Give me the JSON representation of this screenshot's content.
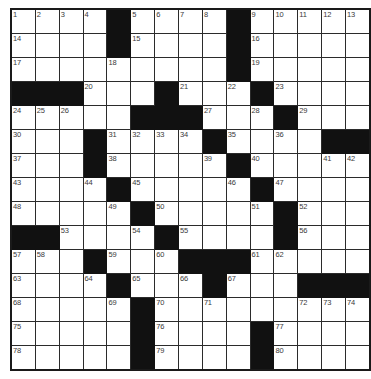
{
  "puzzle": {
    "title": "Crossword Grid",
    "rows": 15,
    "cols": 15,
    "cell_size_px": 23,
    "colors": {
      "block": "#111111",
      "cell": "#ffffff",
      "border": "#2b2b2b",
      "number": "#3a3a3a"
    },
    "grid": [
      [
        {
          "type": "cell",
          "number": "1"
        },
        {
          "type": "cell",
          "number": "2"
        },
        {
          "type": "cell",
          "number": "3"
        },
        {
          "type": "cell",
          "number": "4"
        },
        {
          "type": "block"
        },
        {
          "type": "cell",
          "number": "5"
        },
        {
          "type": "cell",
          "number": "6"
        },
        {
          "type": "cell",
          "number": "7"
        },
        {
          "type": "cell",
          "number": "8"
        },
        {
          "type": "block"
        },
        {
          "type": "cell",
          "number": "9"
        },
        {
          "type": "cell",
          "number": "10"
        },
        {
          "type": "cell",
          "number": "11"
        },
        {
          "type": "cell",
          "number": "12"
        },
        {
          "type": "cell",
          "number": "13"
        }
      ],
      [
        {
          "type": "cell",
          "number": "14"
        },
        {
          "type": "cell"
        },
        {
          "type": "cell"
        },
        {
          "type": "cell"
        },
        {
          "type": "block"
        },
        {
          "type": "cell",
          "number": "15"
        },
        {
          "type": "cell"
        },
        {
          "type": "cell"
        },
        {
          "type": "cell"
        },
        {
          "type": "block"
        },
        {
          "type": "cell",
          "number": "16"
        },
        {
          "type": "cell"
        },
        {
          "type": "cell"
        },
        {
          "type": "cell"
        },
        {
          "type": "cell"
        }
      ],
      [
        {
          "type": "cell",
          "number": "17"
        },
        {
          "type": "cell"
        },
        {
          "type": "cell"
        },
        {
          "type": "cell"
        },
        {
          "type": "cell",
          "number": "18"
        },
        {
          "type": "cell"
        },
        {
          "type": "cell"
        },
        {
          "type": "cell"
        },
        {
          "type": "cell"
        },
        {
          "type": "block"
        },
        {
          "type": "cell",
          "number": "19"
        },
        {
          "type": "cell"
        },
        {
          "type": "cell"
        },
        {
          "type": "cell"
        },
        {
          "type": "cell"
        }
      ],
      [
        {
          "type": "block"
        },
        {
          "type": "block"
        },
        {
          "type": "block"
        },
        {
          "type": "cell",
          "number": "20"
        },
        {
          "type": "cell"
        },
        {
          "type": "cell"
        },
        {
          "type": "block"
        },
        {
          "type": "cell",
          "number": "21"
        },
        {
          "type": "cell"
        },
        {
          "type": "cell",
          "number": "22"
        },
        {
          "type": "block"
        },
        {
          "type": "cell",
          "number": "23"
        },
        {
          "type": "cell"
        },
        {
          "type": "cell"
        },
        {
          "type": "cell"
        }
      ],
      [
        {
          "type": "cell",
          "number": "24"
        },
        {
          "type": "cell",
          "number": "25"
        },
        {
          "type": "cell",
          "number": "26"
        },
        {
          "type": "cell"
        },
        {
          "type": "cell"
        },
        {
          "type": "block"
        },
        {
          "type": "block"
        },
        {
          "type": "block"
        },
        {
          "type": "cell",
          "number": "27"
        },
        {
          "type": "cell"
        },
        {
          "type": "cell",
          "number": "28"
        },
        {
          "type": "block"
        },
        {
          "type": "cell",
          "number": "29"
        },
        {
          "type": "cell"
        },
        {
          "type": "cell"
        }
      ],
      [
        {
          "type": "cell",
          "number": "30"
        },
        {
          "type": "cell"
        },
        {
          "type": "cell"
        },
        {
          "type": "block"
        },
        {
          "type": "cell",
          "number": "31"
        },
        {
          "type": "cell",
          "number": "32"
        },
        {
          "type": "cell",
          "number": "33"
        },
        {
          "type": "cell",
          "number": "34"
        },
        {
          "type": "block"
        },
        {
          "type": "cell",
          "number": "35"
        },
        {
          "type": "cell"
        },
        {
          "type": "cell",
          "number": "36"
        },
        {
          "type": "cell"
        },
        {
          "type": "block"
        },
        {
          "type": "block"
        }
      ],
      [
        {
          "type": "cell",
          "number": "37"
        },
        {
          "type": "cell"
        },
        {
          "type": "cell"
        },
        {
          "type": "block"
        },
        {
          "type": "cell",
          "number": "38"
        },
        {
          "type": "cell"
        },
        {
          "type": "cell"
        },
        {
          "type": "cell"
        },
        {
          "type": "cell",
          "number": "39"
        },
        {
          "type": "block"
        },
        {
          "type": "cell",
          "number": "40"
        },
        {
          "type": "cell"
        },
        {
          "type": "cell"
        },
        {
          "type": "cell",
          "number": "41"
        },
        {
          "type": "cell",
          "number": "42"
        }
      ],
      [
        {
          "type": "cell",
          "number": "43"
        },
        {
          "type": "cell"
        },
        {
          "type": "cell"
        },
        {
          "type": "cell",
          "number": "44"
        },
        {
          "type": "block"
        },
        {
          "type": "cell",
          "number": "45"
        },
        {
          "type": "cell"
        },
        {
          "type": "cell"
        },
        {
          "type": "cell"
        },
        {
          "type": "cell",
          "number": "46"
        },
        {
          "type": "block"
        },
        {
          "type": "cell",
          "number": "47"
        },
        {
          "type": "cell"
        },
        {
          "type": "cell"
        },
        {
          "type": "cell"
        }
      ],
      [
        {
          "type": "cell",
          "number": "48"
        },
        {
          "type": "cell"
        },
        {
          "type": "cell"
        },
        {
          "type": "cell"
        },
        {
          "type": "cell",
          "number": "49"
        },
        {
          "type": "block"
        },
        {
          "type": "cell",
          "number": "50"
        },
        {
          "type": "cell"
        },
        {
          "type": "cell"
        },
        {
          "type": "cell"
        },
        {
          "type": "cell",
          "number": "51"
        },
        {
          "type": "block"
        },
        {
          "type": "cell",
          "number": "52"
        },
        {
          "type": "cell"
        },
        {
          "type": "cell"
        }
      ],
      [
        {
          "type": "block"
        },
        {
          "type": "block"
        },
        {
          "type": "cell",
          "number": "53"
        },
        {
          "type": "cell"
        },
        {
          "type": "cell"
        },
        {
          "type": "cell",
          "number": "54"
        },
        {
          "type": "block"
        },
        {
          "type": "cell",
          "number": "55"
        },
        {
          "type": "cell"
        },
        {
          "type": "cell"
        },
        {
          "type": "cell"
        },
        {
          "type": "block"
        },
        {
          "type": "cell",
          "number": "56"
        },
        {
          "type": "cell"
        },
        {
          "type": "cell"
        }
      ],
      [
        {
          "type": "cell",
          "number": "57"
        },
        {
          "type": "cell",
          "number": "58"
        },
        {
          "type": "cell"
        },
        {
          "type": "block"
        },
        {
          "type": "cell",
          "number": "59"
        },
        {
          "type": "cell"
        },
        {
          "type": "cell",
          "number": "60"
        },
        {
          "type": "block"
        },
        {
          "type": "block"
        },
        {
          "type": "block"
        },
        {
          "type": "cell",
          "number": "61"
        },
        {
          "type": "cell",
          "number": "62"
        },
        {
          "type": "cell"
        },
        {
          "type": "cell"
        },
        {
          "type": "cell"
        }
      ],
      [
        {
          "type": "cell",
          "number": "63"
        },
        {
          "type": "cell"
        },
        {
          "type": "cell"
        },
        {
          "type": "cell",
          "number": "64"
        },
        {
          "type": "block"
        },
        {
          "type": "cell",
          "number": "65"
        },
        {
          "type": "cell"
        },
        {
          "type": "cell",
          "number": "66"
        },
        {
          "type": "block"
        },
        {
          "type": "cell",
          "number": "67"
        },
        {
          "type": "cell"
        },
        {
          "type": "cell"
        },
        {
          "type": "block"
        },
        {
          "type": "block"
        },
        {
          "type": "block"
        }
      ],
      [
        {
          "type": "cell",
          "number": "68"
        },
        {
          "type": "cell"
        },
        {
          "type": "cell"
        },
        {
          "type": "cell"
        },
        {
          "type": "cell",
          "number": "69"
        },
        {
          "type": "block"
        },
        {
          "type": "cell",
          "number": "70"
        },
        {
          "type": "cell"
        },
        {
          "type": "cell",
          "number": "71"
        },
        {
          "type": "cell"
        },
        {
          "type": "cell"
        },
        {
          "type": "cell"
        },
        {
          "type": "cell",
          "number": "72"
        },
        {
          "type": "cell",
          "number": "73"
        },
        {
          "type": "cell",
          "number": "74"
        }
      ],
      [
        {
          "type": "cell",
          "number": "75"
        },
        {
          "type": "cell"
        },
        {
          "type": "cell"
        },
        {
          "type": "cell"
        },
        {
          "type": "cell"
        },
        {
          "type": "block"
        },
        {
          "type": "cell",
          "number": "76"
        },
        {
          "type": "cell"
        },
        {
          "type": "cell"
        },
        {
          "type": "cell"
        },
        {
          "type": "block"
        },
        {
          "type": "cell",
          "number": "77"
        },
        {
          "type": "cell"
        },
        {
          "type": "cell"
        },
        {
          "type": "cell"
        }
      ],
      [
        {
          "type": "cell",
          "number": "78"
        },
        {
          "type": "cell"
        },
        {
          "type": "cell"
        },
        {
          "type": "cell"
        },
        {
          "type": "cell"
        },
        {
          "type": "block"
        },
        {
          "type": "cell",
          "number": "79"
        },
        {
          "type": "cell"
        },
        {
          "type": "cell"
        },
        {
          "type": "cell"
        },
        {
          "type": "block"
        },
        {
          "type": "cell",
          "number": "80"
        },
        {
          "type": "cell"
        },
        {
          "type": "cell"
        },
        {
          "type": "cell"
        }
      ]
    ]
  }
}
